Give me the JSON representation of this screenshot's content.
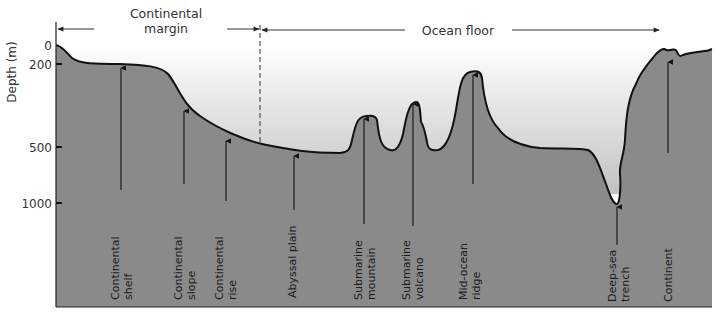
{
  "diagram": {
    "axis": {
      "label": "Depth (m)",
      "ticks": [
        {
          "label": "0",
          "y": 45
        },
        {
          "label": "200",
          "y": 64
        },
        {
          "label": "500",
          "y": 147
        },
        {
          "label": "1000",
          "y": 203
        }
      ]
    },
    "regions": {
      "continental_margin": {
        "line1": "Continental",
        "line2": "margin"
      },
      "ocean_floor": {
        "label": "Ocean floor"
      }
    },
    "features": [
      {
        "id": "continental-shelf",
        "line1": "Continental",
        "line2": "shelf"
      },
      {
        "id": "continental-slope",
        "line1": "Continental",
        "line2": "slope"
      },
      {
        "id": "continental-rise",
        "line1": "Continental",
        "line2": "rise"
      },
      {
        "id": "abyssal-plain",
        "line1": "Abyssal plain",
        "line2": ""
      },
      {
        "id": "submarine-mountain",
        "line1": "Submarine",
        "line2": "mountain"
      },
      {
        "id": "submarine-volcano",
        "line1": "Submarine",
        "line2": "volcano"
      },
      {
        "id": "mid-ocean-ridge",
        "line1": "Mid-ocean",
        "line2": "ridge"
      },
      {
        "id": "deep-sea-trench",
        "line1": "Deep-sea",
        "line2": "trench"
      },
      {
        "id": "continent",
        "line1": "Continent",
        "line2": ""
      }
    ],
    "colors": {
      "seafloor": "#8a8a8a",
      "water_top": "#ffffff",
      "water_bottom": "#c4c4c4",
      "outline": "#111111"
    }
  }
}
